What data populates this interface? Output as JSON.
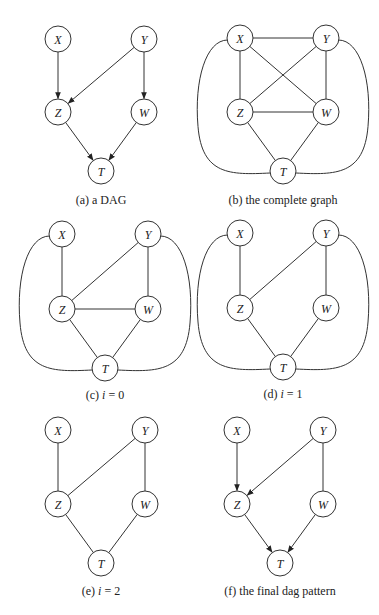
{
  "figure": {
    "node_radius": 13,
    "stroke_color": "#333333",
    "panels": [
      {
        "id": "a",
        "caption": "(a) a DAG",
        "caption_pos": [
          101,
          204
        ],
        "nodes": {
          "X": [
            58,
            39
          ],
          "Y": [
            144,
            39
          ],
          "Z": [
            58,
            112
          ],
          "W": [
            144,
            112
          ],
          "T": [
            101,
            171
          ]
        },
        "edges": [
          {
            "from": "X",
            "to": "Z",
            "directed": true
          },
          {
            "from": "Y",
            "to": "Z",
            "directed": true
          },
          {
            "from": "Y",
            "to": "W",
            "directed": true
          },
          {
            "from": "Z",
            "to": "T",
            "directed": true
          },
          {
            "from": "W",
            "to": "T",
            "directed": true
          }
        ],
        "arcs": []
      },
      {
        "id": "b",
        "caption": "(b) the complete graph",
        "caption_pos": [
          283,
          204
        ],
        "nodes": {
          "X": [
            240,
            38
          ],
          "Y": [
            326,
            38
          ],
          "Z": [
            240,
            112
          ],
          "W": [
            326,
            112
          ],
          "T": [
            283,
            171
          ]
        },
        "edges": [
          {
            "from": "X",
            "to": "Y",
            "directed": false
          },
          {
            "from": "X",
            "to": "Z",
            "directed": false
          },
          {
            "from": "X",
            "to": "W",
            "directed": false
          },
          {
            "from": "Y",
            "to": "Z",
            "directed": false
          },
          {
            "from": "Y",
            "to": "W",
            "directed": false
          },
          {
            "from": "Z",
            "to": "W",
            "directed": false
          },
          {
            "from": "Z",
            "to": "T",
            "directed": false
          },
          {
            "from": "W",
            "to": "T",
            "directed": false
          }
        ],
        "arcs": [
          {
            "from": "X",
            "to": "T",
            "side": "left"
          },
          {
            "from": "Y",
            "to": "T",
            "side": "right"
          }
        ]
      },
      {
        "id": "c",
        "caption": "(c) i = 0",
        "caption_pos": [
          105,
          399
        ],
        "nodes": {
          "X": [
            62,
            234
          ],
          "Y": [
            148,
            234
          ],
          "Z": [
            62,
            309
          ],
          "W": [
            148,
            309
          ],
          "T": [
            105,
            368
          ]
        },
        "edges": [
          {
            "from": "X",
            "to": "Z",
            "directed": false
          },
          {
            "from": "Y",
            "to": "Z",
            "directed": false
          },
          {
            "from": "Y",
            "to": "W",
            "directed": false
          },
          {
            "from": "Z",
            "to": "W",
            "directed": false
          },
          {
            "from": "Z",
            "to": "T",
            "directed": false
          },
          {
            "from": "W",
            "to": "T",
            "directed": false
          }
        ],
        "arcs": [
          {
            "from": "X",
            "to": "T",
            "side": "left"
          },
          {
            "from": "Y",
            "to": "T",
            "side": "right"
          }
        ]
      },
      {
        "id": "d",
        "caption": "(d) i = 1",
        "caption_pos": [
          283,
          398
        ],
        "nodes": {
          "X": [
            240,
            233
          ],
          "Y": [
            326,
            233
          ],
          "Z": [
            240,
            308
          ],
          "W": [
            326,
            308
          ],
          "T": [
            283,
            367
          ]
        },
        "edges": [
          {
            "from": "X",
            "to": "Z",
            "directed": false
          },
          {
            "from": "Y",
            "to": "Z",
            "directed": false
          },
          {
            "from": "Y",
            "to": "W",
            "directed": false
          },
          {
            "from": "Z",
            "to": "T",
            "directed": false
          },
          {
            "from": "W",
            "to": "T",
            "directed": false
          }
        ],
        "arcs": [
          {
            "from": "X",
            "to": "T",
            "side": "left"
          },
          {
            "from": "Y",
            "to": "T",
            "side": "right"
          }
        ]
      },
      {
        "id": "e",
        "caption": "(e) i = 2",
        "caption_pos": [
          101,
          595
        ],
        "nodes": {
          "X": [
            58,
            430
          ],
          "Y": [
            145,
            430
          ],
          "Z": [
            58,
            504
          ],
          "W": [
            145,
            504
          ],
          "T": [
            101,
            563
          ]
        },
        "edges": [
          {
            "from": "X",
            "to": "Z",
            "directed": false
          },
          {
            "from": "Y",
            "to": "Z",
            "directed": false
          },
          {
            "from": "Y",
            "to": "W",
            "directed": false
          },
          {
            "from": "Z",
            "to": "T",
            "directed": false
          },
          {
            "from": "W",
            "to": "T",
            "directed": false
          }
        ],
        "arcs": []
      },
      {
        "id": "f",
        "caption": "(f) the final dag pattern",
        "caption_pos": [
          280,
          595
        ],
        "nodes": {
          "X": [
            237,
            430
          ],
          "Y": [
            323,
            430
          ],
          "Z": [
            237,
            504
          ],
          "W": [
            323,
            504
          ],
          "T": [
            280,
            563
          ]
        },
        "edges": [
          {
            "from": "X",
            "to": "Z",
            "directed": true
          },
          {
            "from": "Y",
            "to": "Z",
            "directed": true
          },
          {
            "from": "Y",
            "to": "W",
            "directed": false
          },
          {
            "from": "Z",
            "to": "T",
            "directed": true
          },
          {
            "from": "W",
            "to": "T",
            "directed": true
          }
        ],
        "arcs": []
      }
    ]
  }
}
